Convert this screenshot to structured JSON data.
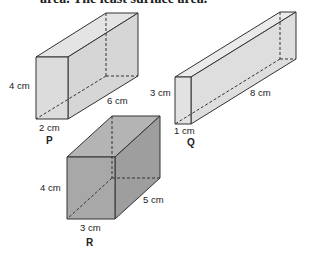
{
  "header_text": "area. The least surface area.",
  "shapes": {
    "P": {
      "name": "P",
      "height": "4 cm",
      "width": "2 cm",
      "length": "6 cm",
      "fill": "#dcdcdc"
    },
    "Q": {
      "name": "Q",
      "height": "3 cm",
      "width": "1 cm",
      "length": "8 cm",
      "fill": "#e2e2e2"
    },
    "R": {
      "name": "R",
      "height": "4 cm",
      "width": "3 cm",
      "length": "5 cm",
      "fill": "#a8a8a8"
    }
  }
}
